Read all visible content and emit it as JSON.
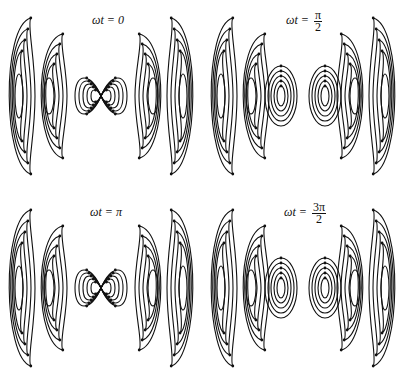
{
  "figure": {
    "line_color": "#111111",
    "background": "#ffffff",
    "panels": [
      {
        "id": "p0",
        "label_prefix": "ωt = ",
        "label_value": "0",
        "num": "",
        "den": "",
        "phase": "0",
        "center": [
          104,
          96
        ],
        "near_field": "dipole-lobes"
      },
      {
        "id": "p1",
        "label_prefix": "ωt = ",
        "label_value": "",
        "num": "π",
        "den": "2",
        "phase": "π/2",
        "center": [
          301,
          96
        ],
        "near_field": "closed-loops"
      },
      {
        "id": "p2",
        "label_prefix": "ωt = ",
        "label_value": "π",
        "num": "",
        "den": "",
        "phase": "π",
        "center": [
          104,
          288
        ],
        "near_field": "dipole-lobes"
      },
      {
        "id": "p3",
        "label_prefix": "ωt = ",
        "label_value": "",
        "num": "3π",
        "den": "2",
        "phase": "3π/2",
        "center": [
          301,
          288
        ],
        "near_field": "closed-loops"
      }
    ]
  }
}
